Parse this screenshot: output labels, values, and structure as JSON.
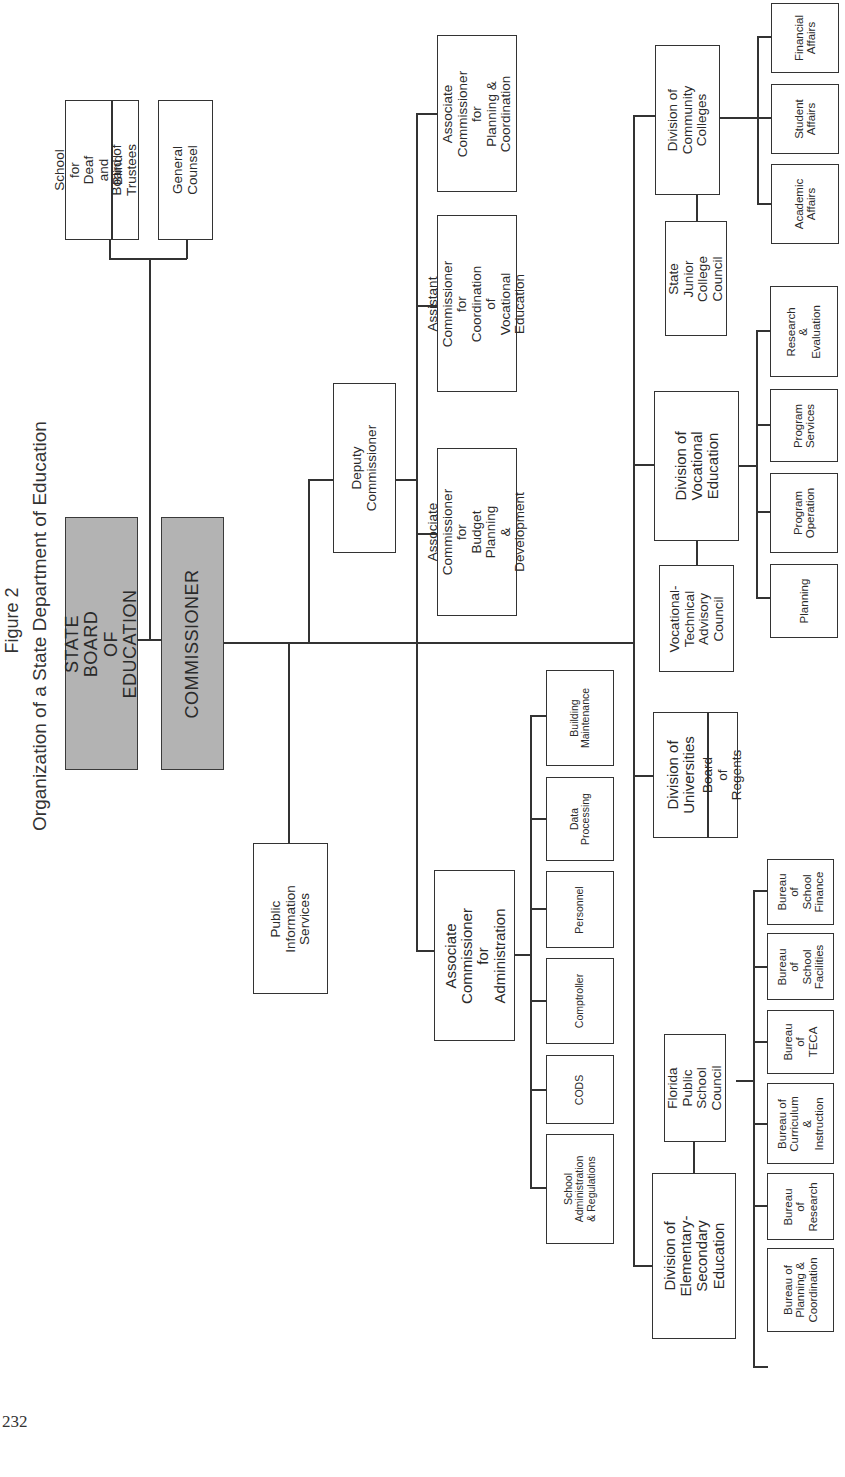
{
  "figure": {
    "label": "Figure 2",
    "title": "Organization of a State Department of Education",
    "page_number": "232"
  },
  "top_level": {
    "state_board": "STATE BOARD\nOF EDUCATION",
    "commissioner": "COMMISSIONER"
  },
  "board_attached": {
    "school_deaf_blind": "School for\nDeaf and Blind",
    "board_of_trustees": "Board of Trustees",
    "general_counsel": "General Counsel"
  },
  "staff": {
    "public_information": "Public\nInformation\nServices",
    "deputy_commissioner": "Deputy\nCommissioner"
  },
  "deputy_units": {
    "planning_coordination": "Associate\nCommissioner for\nPlanning &\nCoordination",
    "vocational_coordination": "Assistant\nCommissioner for\nCoordination of\nVocational Education",
    "budget_planning": "Associate\nCommissioner for\nBudget Planning\n& Development",
    "administration": "Associate\nCommissioner for\nAdministration"
  },
  "administration_units": [
    "Building\nMaintenance",
    "Data\nProcessing",
    "Personnel",
    "Comptroller",
    "CODS",
    "School\nAdministration\n& Regulations"
  ],
  "divisions": {
    "community_colleges": {
      "name": "Division of\nCommunity\nColleges",
      "council": "State Junior\nCollege\nCouncil",
      "units": [
        "Financial\nAffairs",
        "Student\nAffairs",
        "Academic\nAffairs"
      ]
    },
    "vocational": {
      "name": "Division of\nVocational\nEducation",
      "council": "Vocational-\nTechnical\nAdvisory\nCouncil",
      "units": [
        "Research &\nEvaluation",
        "Program\nServices",
        "Program\nOperation",
        "Planning"
      ]
    },
    "universities": {
      "name": "Division of\nUniversities",
      "board": "Board of Regents"
    },
    "elementary_secondary": {
      "name": "Division of\nElementary-\nSecondary\nEducation",
      "council": "Florida Public\nSchool\nCouncil",
      "units": [
        "Bureau of\nSchool\nFinance",
        "Bureau of\nSchool\nFacilities",
        "Bureau of\nTECA",
        "Bureau of\nCurriculum &\nInstruction",
        "Bureau of\nResearch",
        "Bureau of\nPlanning &\nCoordination"
      ]
    }
  },
  "colors": {
    "line": "#333333",
    "top_box_fill": "#b3b3b3",
    "background": "#ffffff"
  }
}
